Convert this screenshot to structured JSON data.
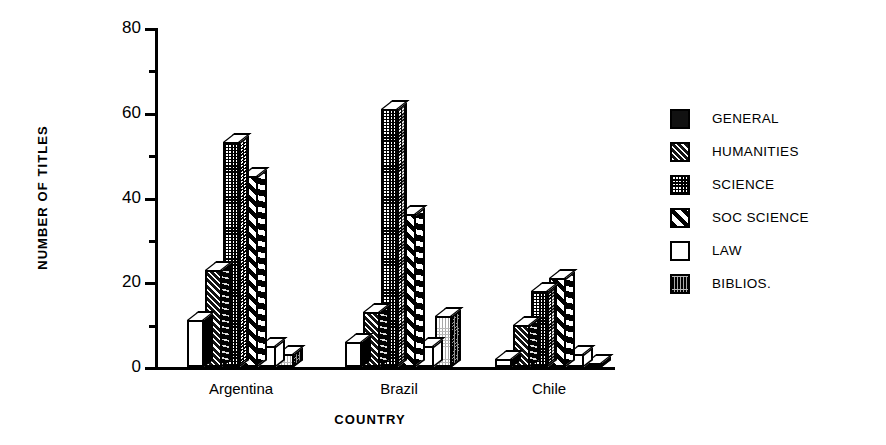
{
  "chart_data": {
    "type": "bar",
    "title": "",
    "xlabel": "COUNTRY",
    "ylabel": "NUMBER OF TITLES",
    "categories": [
      "Argentina",
      "Brazil",
      "Chile"
    ],
    "ylim": [
      0,
      80
    ],
    "yticks": [
      0,
      20,
      40,
      60,
      80
    ],
    "ytick_labels": [
      "0",
      "20",
      "40",
      "60",
      "80"
    ],
    "yminor_ticks": [
      10,
      30,
      50,
      70
    ],
    "grid": false,
    "legend_position": "right",
    "series": [
      {
        "name": "GENERAL",
        "pattern": "solid-black",
        "values": [
          11,
          6,
          2
        ]
      },
      {
        "name": "HUMANITIES",
        "pattern": "fine-hatch",
        "values": [
          23,
          13,
          10
        ]
      },
      {
        "name": "SCIENCE",
        "pattern": "checkered-dots",
        "values": [
          53,
          61,
          18
        ]
      },
      {
        "name": "SOC SCIENCE",
        "pattern": "diagonal-stripe",
        "values": [
          45,
          36,
          21
        ]
      },
      {
        "name": "LAW",
        "pattern": "white",
        "values": [
          5,
          5,
          3
        ]
      },
      {
        "name": "BIBLIOS.",
        "pattern": "dark-speckle",
        "values": [
          3,
          12,
          1
        ]
      }
    ]
  },
  "legend": {
    "items": [
      {
        "label": "GENERAL"
      },
      {
        "label": "HUMANITIES"
      },
      {
        "label": "SCIENCE"
      },
      {
        "label": "SOC SCIENCE"
      },
      {
        "label": "LAW"
      },
      {
        "label": "BIBLIOS."
      }
    ]
  }
}
